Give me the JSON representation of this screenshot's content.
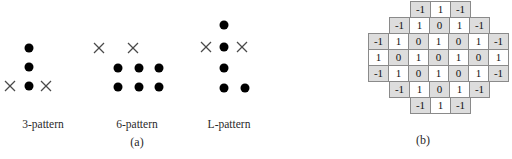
{
  "figure": {
    "panels": [
      {
        "id": "panel-a",
        "caption": "(a)",
        "patterns": [
          {
            "label": "3-pattern",
            "label_x": 43,
            "label_y": 118,
            "center_x": 30,
            "dots": [
              {
                "x": 29,
                "y": 48
              },
              {
                "x": 29,
                "y": 67
              },
              {
                "x": 29,
                "y": 86
              }
            ],
            "crosses": [
              {
                "x": 10,
                "y": 86
              },
              {
                "x": 46,
                "y": 86
              }
            ]
          },
          {
            "label": "6-pattern",
            "label_x": 137,
            "label_y": 118,
            "center_x": 124,
            "dots": [
              {
                "x": 118,
                "y": 68
              },
              {
                "x": 139,
                "y": 68
              },
              {
                "x": 159,
                "y": 68
              },
              {
                "x": 118,
                "y": 87
              },
              {
                "x": 139,
                "y": 87
              },
              {
                "x": 159,
                "y": 87
              }
            ],
            "crosses": [
              {
                "x": 99,
                "y": 48
              },
              {
                "x": 133,
                "y": 48
              }
            ]
          },
          {
            "label": "L-pattern",
            "label_x": 229,
            "label_y": 118,
            "center_x": 222,
            "dots": [
              {
                "x": 224,
                "y": 25
              },
              {
                "x": 224,
                "y": 47
              },
              {
                "x": 224,
                "y": 68
              },
              {
                "x": 224,
                "y": 88
              },
              {
                "x": 245,
                "y": 88
              }
            ],
            "crosses": [
              {
                "x": 206,
                "y": 47
              },
              {
                "x": 242,
                "y": 47
              }
            ]
          }
        ],
        "caption_x": 137,
        "caption_y": 135
      },
      {
        "id": "panel-b",
        "caption": "(b)",
        "caption_x": 153,
        "caption_y": 133
      }
    ]
  },
  "grid_data": {
    "type": "table",
    "rows": 7,
    "cols": 7,
    "cells": [
      [
        {
          "v": "",
          "present": false,
          "shaded": false
        },
        {
          "v": "",
          "present": false,
          "shaded": false
        },
        {
          "v": "-1",
          "present": true,
          "shaded": true
        },
        {
          "v": "1",
          "present": true,
          "shaded": false
        },
        {
          "v": "-1",
          "present": true,
          "shaded": true
        },
        {
          "v": "",
          "present": false,
          "shaded": false
        },
        {
          "v": "",
          "present": false,
          "shaded": false
        }
      ],
      [
        {
          "v": "",
          "present": false,
          "shaded": false
        },
        {
          "v": "-1",
          "present": true,
          "shaded": true
        },
        {
          "v": "1",
          "present": true,
          "shaded": false
        },
        {
          "v": "0",
          "present": true,
          "shaded": true
        },
        {
          "v": "1",
          "present": true,
          "shaded": false
        },
        {
          "v": "-1",
          "present": true,
          "shaded": true
        },
        {
          "v": "",
          "present": false,
          "shaded": false
        }
      ],
      [
        {
          "v": "-1",
          "present": true,
          "shaded": true
        },
        {
          "v": "1",
          "present": true,
          "shaded": false
        },
        {
          "v": "0",
          "present": true,
          "shaded": true
        },
        {
          "v": "1",
          "present": true,
          "shaded": false
        },
        {
          "v": "0",
          "present": true,
          "shaded": true
        },
        {
          "v": "1",
          "present": true,
          "shaded": false
        },
        {
          "v": "-1",
          "present": true,
          "shaded": true
        }
      ],
      [
        {
          "v": "1",
          "present": true,
          "shaded": false
        },
        {
          "v": "0",
          "present": true,
          "shaded": true
        },
        {
          "v": "1",
          "present": true,
          "shaded": false
        },
        {
          "v": "0",
          "present": true,
          "shaded": true
        },
        {
          "v": "1",
          "present": true,
          "shaded": false
        },
        {
          "v": "0",
          "present": true,
          "shaded": true
        },
        {
          "v": "1",
          "present": true,
          "shaded": false
        }
      ],
      [
        {
          "v": "-1",
          "present": true,
          "shaded": true
        },
        {
          "v": "1",
          "present": true,
          "shaded": false
        },
        {
          "v": "0",
          "present": true,
          "shaded": true
        },
        {
          "v": "1",
          "present": true,
          "shaded": false
        },
        {
          "v": "0",
          "present": true,
          "shaded": true
        },
        {
          "v": "1",
          "present": true,
          "shaded": false
        },
        {
          "v": "-1",
          "present": true,
          "shaded": true
        }
      ],
      [
        {
          "v": "",
          "present": false,
          "shaded": false
        },
        {
          "v": "-1",
          "present": true,
          "shaded": true
        },
        {
          "v": "1",
          "present": true,
          "shaded": false
        },
        {
          "v": "0",
          "present": true,
          "shaded": true
        },
        {
          "v": "1",
          "present": true,
          "shaded": false
        },
        {
          "v": "-1",
          "present": true,
          "shaded": true
        },
        {
          "v": "",
          "present": false,
          "shaded": false
        }
      ],
      [
        {
          "v": "",
          "present": false,
          "shaded": false
        },
        {
          "v": "",
          "present": false,
          "shaded": false
        },
        {
          "v": "-1",
          "present": true,
          "shaded": true
        },
        {
          "v": "1",
          "present": true,
          "shaded": false
        },
        {
          "v": "-1",
          "present": true,
          "shaded": true
        },
        {
          "v": "",
          "present": false,
          "shaded": false
        },
        {
          "v": "",
          "present": false,
          "shaded": false
        }
      ]
    ]
  },
  "colors": {
    "dot": "#000000",
    "cross": "#4a4a4a",
    "cell_border": "#8a8a8a",
    "cell_shaded": "#dddddd",
    "cell_plain": "#ffffff",
    "text": "#1a1a1a",
    "background": "#ffffff"
  }
}
